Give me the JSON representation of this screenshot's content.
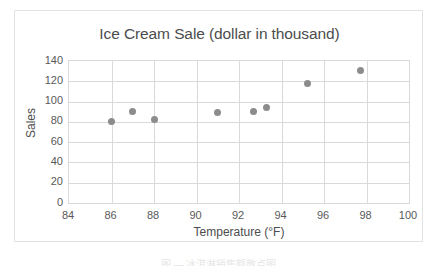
{
  "chart_data": {
    "type": "scatter",
    "title": "Ice Cream Sale (dollar in thousand)",
    "xlabel": "Temperature (°F)",
    "ylabel": "Sales",
    "xlim": [
      84,
      100
    ],
    "ylim": [
      0,
      140
    ],
    "xticks": [
      84,
      86,
      88,
      90,
      92,
      94,
      96,
      98,
      100
    ],
    "yticks": [
      0,
      20,
      40,
      60,
      80,
      100,
      120,
      140
    ],
    "grid": true,
    "legend": null,
    "marker_color": "#8c8c8c",
    "points": [
      {
        "x": 86.0,
        "y": 80
      },
      {
        "x": 87.0,
        "y": 90
      },
      {
        "x": 88.0,
        "y": 82
      },
      {
        "x": 91.0,
        "y": 89
      },
      {
        "x": 92.7,
        "y": 90
      },
      {
        "x": 93.3,
        "y": 94
      },
      {
        "x": 95.2,
        "y": 118
      },
      {
        "x": 97.7,
        "y": 131
      }
    ]
  },
  "figure": {
    "caption": "图  —  冰淇淋销售额散点图",
    "frame_color": "#e3e3e3",
    "grid_color": "#d9d9d9",
    "text_color": "#4d4d4d"
  }
}
